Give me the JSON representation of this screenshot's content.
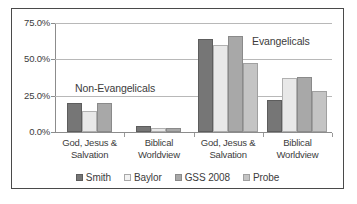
{
  "chart_data": {
    "type": "bar",
    "title": "",
    "xlabel": "",
    "ylabel": "",
    "ylim": [
      0,
      75
    ],
    "grid": true,
    "legend_position": "bottom",
    "categories": [
      "God, Jesus & Salvation",
      "Biblical Worldview",
      "God, Jesus & Salvation",
      "Biblical Worldview"
    ],
    "category_lines": [
      [
        "God, Jesus &",
        "Salvation"
      ],
      [
        "Biblical",
        "Worldview"
      ],
      [
        "God, Jesus &",
        "Salvation"
      ],
      [
        "Biblical",
        "Worldview"
      ]
    ],
    "series": [
      {
        "name": "Smith",
        "color": "#767676",
        "values": [
          20.0,
          4.0,
          64.0,
          22.0
        ]
      },
      {
        "name": "Baylor",
        "color": "#e8e8e8",
        "values": [
          14.5,
          2.5,
          60.0,
          37.5
        ]
      },
      {
        "name": "GSS 2008",
        "color": "#a8a8a8",
        "values": [
          20.0,
          2.5,
          66.0,
          38.0
        ]
      },
      {
        "name": "Probe",
        "color": "#c4c4c4",
        "values": [
          null,
          null,
          47.5,
          28.5
        ]
      }
    ],
    "ytick_labels": [
      "75.0%",
      "50.0%",
      "25.0%",
      "0.0%"
    ],
    "ytick_values": [
      75,
      50,
      25,
      0
    ],
    "annotations": [
      {
        "text": "Non-Evangelicals",
        "covers_categories": [
          0,
          1
        ]
      },
      {
        "text": "Evangelicals",
        "covers_categories": [
          2,
          3
        ]
      }
    ]
  }
}
